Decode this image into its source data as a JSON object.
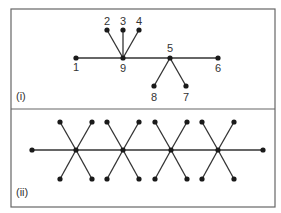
{
  "style": {
    "line_color": "#333333",
    "node_color": "#1a1a1a",
    "border_color": "#666666",
    "background": "#ffffff",
    "node_radius": 2.6,
    "edge_width": 1.3
  },
  "frame": {
    "x": 11,
    "y": 9,
    "w": 264,
    "h": 198,
    "divider_y": 109
  },
  "panels": [
    {
      "id": "i",
      "label": "(i)",
      "label_pos": [
        16,
        100
      ],
      "nodes": [
        {
          "id": "1",
          "label": "1",
          "x": 76,
          "y": 58,
          "lx": 76,
          "ly": 71
        },
        {
          "id": "2",
          "label": "2",
          "x": 107,
          "y": 30,
          "lx": 107,
          "ly": 25
        },
        {
          "id": "3",
          "label": "3",
          "x": 123,
          "y": 30,
          "lx": 123,
          "ly": 25
        },
        {
          "id": "4",
          "label": "4",
          "x": 139,
          "y": 30,
          "lx": 139,
          "ly": 25
        },
        {
          "id": "5",
          "label": "5",
          "x": 170,
          "y": 58,
          "lx": 170,
          "ly": 52
        },
        {
          "id": "6",
          "label": "6",
          "x": 218,
          "y": 58,
          "lx": 218,
          "ly": 72
        },
        {
          "id": "7",
          "label": "7",
          "x": 186,
          "y": 86,
          "lx": 186,
          "ly": 101
        },
        {
          "id": "8",
          "label": "8",
          "x": 154,
          "y": 86,
          "lx": 154,
          "ly": 101
        },
        {
          "id": "9",
          "label": "9",
          "x": 123,
          "y": 58,
          "lx": 123,
          "ly": 72
        }
      ],
      "edges": [
        [
          "1",
          "9"
        ],
        [
          "9",
          "5"
        ],
        [
          "5",
          "6"
        ],
        [
          "2",
          "9"
        ],
        [
          "3",
          "9"
        ],
        [
          "4",
          "9"
        ],
        [
          "5",
          "8"
        ],
        [
          "5",
          "7"
        ]
      ]
    },
    {
      "id": "ii",
      "label": "(ii)",
      "label_pos": [
        16,
        196
      ],
      "nodes": [
        {
          "id": "L",
          "x": 32,
          "y": 150
        },
        {
          "id": "h1",
          "x": 76,
          "y": 150
        },
        {
          "id": "h1a",
          "x": 60,
          "y": 122
        },
        {
          "id": "h1b",
          "x": 92,
          "y": 122
        },
        {
          "id": "h1c",
          "x": 60,
          "y": 179
        },
        {
          "id": "h1d",
          "x": 92,
          "y": 179
        },
        {
          "id": "h2",
          "x": 123,
          "y": 150
        },
        {
          "id": "h2a",
          "x": 107,
          "y": 122
        },
        {
          "id": "h2b",
          "x": 139,
          "y": 122
        },
        {
          "id": "h2c",
          "x": 107,
          "y": 179
        },
        {
          "id": "h2d",
          "x": 139,
          "y": 179
        },
        {
          "id": "h3",
          "x": 171,
          "y": 150
        },
        {
          "id": "h3a",
          "x": 155,
          "y": 122
        },
        {
          "id": "h3b",
          "x": 187,
          "y": 122
        },
        {
          "id": "h3c",
          "x": 155,
          "y": 179
        },
        {
          "id": "h3d",
          "x": 187,
          "y": 179
        },
        {
          "id": "h4",
          "x": 218,
          "y": 150
        },
        {
          "id": "h4a",
          "x": 202,
          "y": 122
        },
        {
          "id": "h4b",
          "x": 234,
          "y": 122
        },
        {
          "id": "h4c",
          "x": 202,
          "y": 179
        },
        {
          "id": "h4d",
          "x": 234,
          "y": 179
        },
        {
          "id": "R",
          "x": 263,
          "y": 150
        }
      ],
      "edges": [
        [
          "L",
          "h1"
        ],
        [
          "h1",
          "h2"
        ],
        [
          "h2",
          "h3"
        ],
        [
          "h3",
          "h4"
        ],
        [
          "h4",
          "R"
        ],
        [
          "h1",
          "h1a"
        ],
        [
          "h1",
          "h1b"
        ],
        [
          "h1",
          "h1c"
        ],
        [
          "h1",
          "h1d"
        ],
        [
          "h2",
          "h2a"
        ],
        [
          "h2",
          "h2b"
        ],
        [
          "h2",
          "h2c"
        ],
        [
          "h2",
          "h2d"
        ],
        [
          "h3",
          "h3a"
        ],
        [
          "h3",
          "h3b"
        ],
        [
          "h3",
          "h3c"
        ],
        [
          "h3",
          "h3d"
        ],
        [
          "h4",
          "h4a"
        ],
        [
          "h4",
          "h4b"
        ],
        [
          "h4",
          "h4c"
        ],
        [
          "h4",
          "h4d"
        ]
      ]
    }
  ]
}
